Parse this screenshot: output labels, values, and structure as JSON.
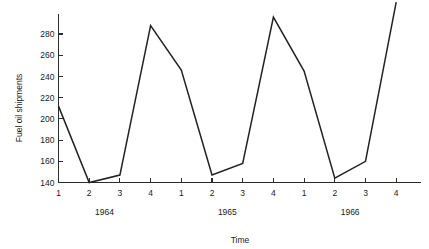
{
  "chart_data": {
    "type": "line",
    "title": "",
    "xlabel": "Time",
    "ylabel": "Fuel oil shipments",
    "ylim": [
      134,
      312
    ],
    "y_ticks": [
      140,
      160,
      180,
      200,
      220,
      240,
      260,
      280
    ],
    "y_tick_labels": [
      "140",
      "160",
      "180",
      "200",
      "220",
      "240",
      "260",
      "280"
    ],
    "categories": [
      "1",
      "2",
      "3",
      "4",
      "1",
      "2",
      "3",
      "4",
      "1",
      "2",
      "3",
      "4"
    ],
    "x_tick_labels": [
      "1",
      "2",
      "3",
      "4",
      "1",
      "2",
      "3",
      "4",
      "1",
      "2",
      "3",
      "4"
    ],
    "group_labels": [
      "1964",
      "1965",
      "1966"
    ],
    "values": [
      212,
      140,
      147,
      288,
      246,
      147,
      158,
      296,
      245,
      144,
      160,
      310
    ],
    "series": [
      {
        "name": "Fuel oil shipments",
        "values": [
          212,
          140,
          147,
          288,
          246,
          147,
          158,
          296,
          245,
          144,
          160,
          310
        ]
      }
    ],
    "grid": false,
    "legend": "none",
    "line_color": "#222222",
    "axis_color": "#2b2b2b"
  }
}
